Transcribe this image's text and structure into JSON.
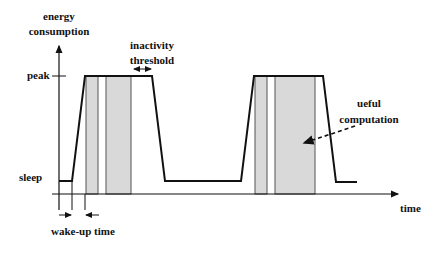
{
  "diagram": {
    "y_axis_label_line1": "energy",
    "y_axis_label_line2": "consumption",
    "x_axis_label": "time",
    "level_peak": "peak",
    "level_sleep": "sleep",
    "annotation_inactivity_line1": "inactivity",
    "annotation_inactivity_line2": "threshold",
    "annotation_useful_line1": "ueful",
    "annotation_useful_line2": "computation",
    "annotation_wakeup": "wake-up time",
    "colors": {
      "line": "#111111",
      "computation_fill": "#d9d9d9",
      "computation_stroke": "#555555"
    }
  }
}
